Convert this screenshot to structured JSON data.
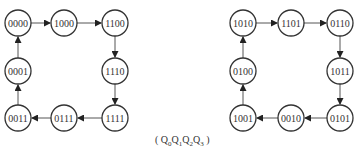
{
  "caption": {
    "open": "( ",
    "q0": "0",
    "q1": "1",
    "q2": "2",
    "q3": "3",
    "close": " )"
  },
  "diagrams": [
    {
      "name": "left-cycle",
      "states": [
        "0000",
        "1000",
        "1100",
        "1110",
        "1111",
        "0111",
        "0011",
        "0001"
      ]
    },
    {
      "name": "right-cycle",
      "states": [
        "1010",
        "1101",
        "0110",
        "1011",
        "0101",
        "0010",
        "1001",
        "0100"
      ]
    }
  ],
  "colors": {
    "stroke": "#333333",
    "edge": "#555555",
    "background": "#ffffff"
  }
}
